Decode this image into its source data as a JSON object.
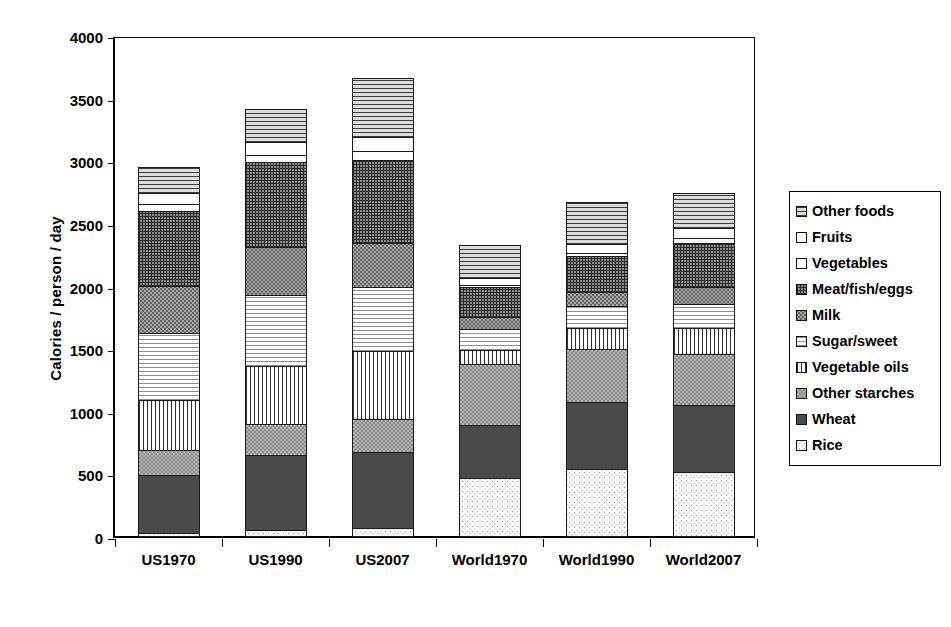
{
  "chart_data": {
    "type": "bar",
    "subtype": "stacked-bar",
    "title": "",
    "xlabel": "",
    "ylabel": "Calories / person / day",
    "ylim": [
      0,
      4000
    ],
    "ytick_step": 500,
    "yticks": [
      "4000",
      "3500",
      "3000",
      "2500",
      "2000",
      "1500",
      "1000",
      "500",
      "0"
    ],
    "grid": false,
    "legend_position": "right",
    "categories": [
      "US1970",
      "US1990",
      "US2007",
      "World1970",
      "World1990",
      "World2007"
    ],
    "series": [
      {
        "name": "Rice",
        "values": [
          30,
          60,
          75,
          470,
          545,
          520
        ]
      },
      {
        "name": "Wheat",
        "values": [
          475,
          600,
          615,
          430,
          545,
          545
        ]
      },
      {
        "name": "Other starches",
        "values": [
          205,
          255,
          265,
          500,
          425,
          415
        ]
      },
      {
        "name": "Vegetable oils",
        "values": [
          405,
          475,
          555,
          115,
          175,
          215
        ]
      },
      {
        "name": "Sugar/sweet",
        "values": [
          545,
          575,
          520,
          180,
          190,
          195
        ]
      },
      {
        "name": "Milk",
        "values": [
          385,
          390,
          355,
          105,
          120,
          145
        ]
      },
      {
        "name": "Meat/fish/eggs",
        "values": [
          610,
          690,
          675,
          245,
          295,
          360
        ]
      },
      {
        "name": "Vegetables",
        "values": [
          60,
          65,
          80,
          25,
          30,
          45
        ]
      },
      {
        "name": "Fruits",
        "values": [
          100,
          110,
          115,
          65,
          80,
          95
        ]
      },
      {
        "name": "Other foods",
        "values": [
          215,
          270,
          485,
          265,
          340,
          285
        ]
      }
    ],
    "totals": [
      "3030",
      "3490",
      "3740",
      "2400",
      "2645",
      "2810"
    ]
  },
  "legend": {
    "items": [
      {
        "label": "Other foods",
        "pattern": "horizontal-lines"
      },
      {
        "label": "Fruits",
        "pattern": "fine-dots-light"
      },
      {
        "label": "Vegetables",
        "pattern": "solid-white"
      },
      {
        "label": "Meat/fish/eggs",
        "pattern": "dark-crosshatch"
      },
      {
        "label": "Milk",
        "pattern": "gray-dots"
      },
      {
        "label": "Sugar/sweet",
        "pattern": "light-horizontal-lines"
      },
      {
        "label": "Vegetable oils",
        "pattern": "vertical-lines"
      },
      {
        "label": "Other starches",
        "pattern": "gray-checker"
      },
      {
        "label": "Wheat",
        "pattern": "solid-dark-gray"
      },
      {
        "label": "Rice",
        "pattern": "very-light-dots"
      }
    ]
  },
  "colors": {
    "axis": "#000000",
    "plot_background": "#ffffff",
    "wheat_fill": "#4a4a4a",
    "milk_fill": "#a8a8a8",
    "other_starches_fill": "#b4b4b4",
    "meat_fill": "#8e8e8e"
  }
}
